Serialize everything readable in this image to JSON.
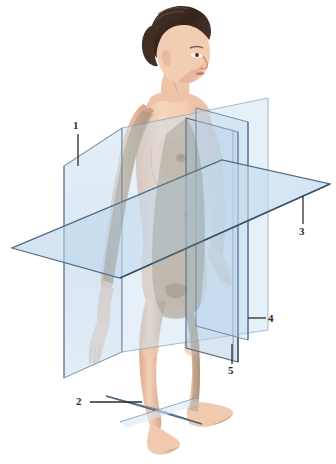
{
  "figure": {
    "background_color": "#ffffff"
  },
  "labels": [
    {
      "id": "1",
      "text": "1",
      "refers_to": "frontal-coronal-plane",
      "leader": "vertical"
    },
    {
      "id": "2",
      "text": "2",
      "refers_to": "transverse-plane-at-ankle",
      "leader": "horizontal"
    },
    {
      "id": "3",
      "text": "3",
      "refers_to": "transverse-horizontal-plane",
      "leader": "vertical"
    },
    {
      "id": "4",
      "text": "4",
      "refers_to": "parasagittal-plane",
      "leader": "horizontal"
    },
    {
      "id": "5",
      "text": "5",
      "refers_to": "median-sagittal-plane",
      "leader": "vertical"
    }
  ],
  "planes": [
    {
      "name": "frontal-coronal-plane",
      "label_id": "1",
      "fill": "#cfe2f1",
      "edge": "#7d93ad",
      "orientation": "vertical, parallel to the page, left of the figure"
    },
    {
      "name": "transverse-horizontal-plane",
      "label_id": "3",
      "fill": "#bcd4ea",
      "edge": "#46637f",
      "orientation": "horizontal parallelogram cutting through the pelvis"
    },
    {
      "name": "parasagittal-plane",
      "label_id": "4",
      "fill": "#c3d9ee",
      "edge": "#5d7ea0",
      "orientation": "vertical, front-to-back, right of midline"
    },
    {
      "name": "median-sagittal-plane",
      "label_id": "5",
      "fill": "#b9d1e8",
      "edge": "#41587a",
      "orientation": "vertical, front-to-back, through the midline"
    },
    {
      "name": "transverse-plane-at-ankle",
      "label_id": "2",
      "fill": "#cfe3f2",
      "edge": "#5a7894",
      "orientation": "small horizontal plane at ankle level"
    }
  ],
  "colors": {
    "plane_light": "#dce9f3",
    "plane_mid": "#bcd4ea",
    "plane_overlap": "#9db3cc",
    "plane_edge_dark": "#3d5874",
    "skin_light": "#f2cdb4",
    "skin_mid": "#e0ae8f",
    "skin_shadow": "#c18f72",
    "hair_dark": "#3b2a22",
    "hair_mid": "#5c4434",
    "body_behind_glass": "#8b8f7e",
    "label_ink": "#2b2b2b"
  }
}
